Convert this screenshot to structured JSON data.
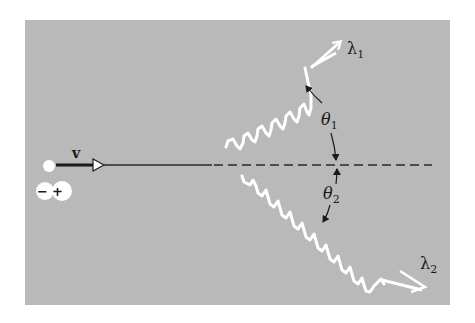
{
  "figure": {
    "background_color": "#b9b9b9",
    "wave_color": "#ffffff",
    "line_color": "#2a2a2a"
  },
  "particle": {
    "label_velocity": "v",
    "charge_minus": "−",
    "charge_plus": "+"
  },
  "photons": [
    {
      "label": "λ",
      "subscript": "1",
      "angle_label": "θ",
      "angle_subscript": "1"
    },
    {
      "label": "λ",
      "subscript": "2",
      "angle_label": "θ",
      "angle_subscript": "2"
    }
  ]
}
